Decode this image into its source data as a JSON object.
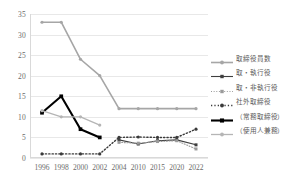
{
  "chart_data": {
    "type": "line",
    "title": "",
    "xlabel": "",
    "ylabel": "",
    "categories": [
      "1996",
      "1998",
      "2000",
      "2002",
      "2004",
      "2010",
      "2015",
      "2020",
      "2022"
    ],
    "ylim": [
      0,
      35
    ],
    "yticks": [
      0,
      5,
      10,
      15,
      20,
      25,
      30,
      35
    ],
    "grid": true,
    "legend_position": "right",
    "series": [
      {
        "name": "取締役員数",
        "color": "#a6a6a6",
        "style": "solid",
        "width": 1.6,
        "marker": "circle",
        "values": [
          33,
          33,
          24,
          20,
          12,
          12,
          12,
          12,
          12
        ]
      },
      {
        "name": "取・執行役",
        "color": "#3f3f3f",
        "style": "solid",
        "width": 1.1,
        "marker": "square",
        "values": [
          null,
          null,
          null,
          null,
          4.4,
          3.4,
          4.2,
          4.4,
          3.2
        ]
      },
      {
        "name": "取・非執行役",
        "color": "#9a9a9a",
        "style": "dotted",
        "width": 1.1,
        "marker": "square",
        "values": [
          null,
          null,
          null,
          null,
          3.8,
          3.6,
          4.0,
          4.2,
          2.2
        ]
      },
      {
        "name": "社外取締役",
        "color": "#3a3a3a",
        "style": "dotted",
        "width": 1.4,
        "marker": "circle",
        "values": [
          1,
          1,
          1,
          1,
          5,
          5.1,
          5,
          5,
          7
        ]
      },
      {
        "name": "（常務取締役）",
        "color": "#000000",
        "style": "solid",
        "width": 2.1,
        "marker": "square",
        "values": [
          11,
          15,
          7,
          5,
          null,
          null,
          null,
          null,
          null
        ]
      },
      {
        "name": "（使用人兼務）",
        "color": "#b5b5b5",
        "style": "solid",
        "width": 1.3,
        "marker": "circle",
        "values": [
          11.5,
          10,
          10,
          8,
          null,
          null,
          null,
          null,
          null
        ]
      }
    ]
  },
  "legend": {
    "items": [
      {
        "label": "取締役員数"
      },
      {
        "label": "取・執行役"
      },
      {
        "label": "取・非執行役"
      },
      {
        "label": "社外取締役"
      },
      {
        "label": "（常務取締役）"
      },
      {
        "label": "（使用人兼務）"
      }
    ]
  }
}
